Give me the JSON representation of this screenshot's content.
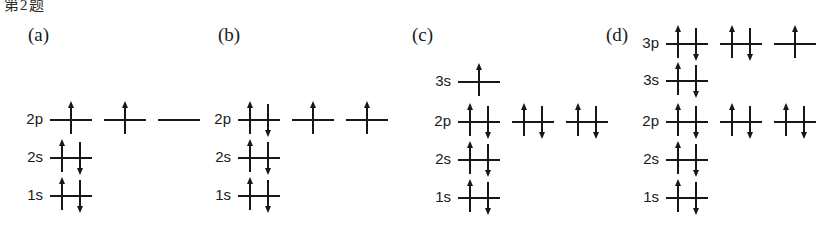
{
  "figure": {
    "crop_remnant_text": "第2题",
    "background_color": "#ffffff",
    "ink_color": "#171717"
  },
  "panels": [
    {
      "id": "a",
      "label": "(a)",
      "label_x": 28,
      "label_y": 25,
      "origin_x": 50,
      "levels": [
        {
          "name": "2p",
          "label": "2p",
          "y": 119,
          "orbitals": [
            {
              "electrons": [
                "up"
              ]
            },
            {
              "electrons": [
                "up"
              ]
            },
            {
              "electrons": []
            }
          ]
        },
        {
          "name": "2s",
          "label": "2s",
          "y": 157,
          "orbitals": [
            {
              "electrons": [
                "up",
                "down"
              ]
            }
          ]
        },
        {
          "name": "1s",
          "label": "1s",
          "y": 195,
          "orbitals": [
            {
              "electrons": [
                "up",
                "down"
              ]
            }
          ]
        }
      ]
    },
    {
      "id": "b",
      "label": "(b)",
      "label_x": 218,
      "label_y": 25,
      "origin_x": 238,
      "levels": [
        {
          "name": "2p",
          "label": "2p",
          "y": 119,
          "orbitals": [
            {
              "electrons": [
                "up",
                "down"
              ]
            },
            {
              "electrons": [
                "up"
              ]
            },
            {
              "electrons": [
                "up"
              ]
            }
          ]
        },
        {
          "name": "2s",
          "label": "2s",
          "y": 157,
          "orbitals": [
            {
              "electrons": [
                "up",
                "down"
              ]
            }
          ]
        },
        {
          "name": "1s",
          "label": "1s",
          "y": 195,
          "orbitals": [
            {
              "electrons": [
                "up",
                "down"
              ]
            }
          ]
        }
      ]
    },
    {
      "id": "c",
      "label": "(c)",
      "label_x": 412,
      "label_y": 25,
      "origin_x": 458,
      "levels": [
        {
          "name": "3s",
          "label": "3s",
          "y": 81,
          "orbitals": [
            {
              "electrons": [
                "up"
              ]
            }
          ]
        },
        {
          "name": "2p",
          "label": "2p",
          "y": 121,
          "orbitals": [
            {
              "electrons": [
                "up",
                "down"
              ]
            },
            {
              "electrons": [
                "up",
                "down"
              ]
            },
            {
              "electrons": [
                "up",
                "down"
              ]
            }
          ]
        },
        {
          "name": "2s",
          "label": "2s",
          "y": 159,
          "orbitals": [
            {
              "electrons": [
                "up",
                "down"
              ]
            }
          ]
        },
        {
          "name": "1s",
          "label": "1s",
          "y": 197,
          "orbitals": [
            {
              "electrons": [
                "up",
                "down"
              ]
            }
          ]
        }
      ]
    },
    {
      "id": "d",
      "label": "(d)",
      "label_x": 606,
      "label_y": 25,
      "origin_x": 666,
      "levels": [
        {
          "name": "3p",
          "label": "3p",
          "y": 43,
          "orbitals": [
            {
              "electrons": [
                "up",
                "down"
              ]
            },
            {
              "electrons": [
                "up",
                "down"
              ]
            },
            {
              "electrons": [
                "up"
              ]
            }
          ]
        },
        {
          "name": "3s",
          "label": "3s",
          "y": 80,
          "orbitals": [
            {
              "electrons": [
                "up",
                "down"
              ]
            }
          ]
        },
        {
          "name": "2p",
          "label": "2p",
          "y": 121,
          "orbitals": [
            {
              "electrons": [
                "up",
                "down"
              ]
            },
            {
              "electrons": [
                "up",
                "down"
              ]
            },
            {
              "electrons": [
                "up",
                "down"
              ]
            }
          ]
        },
        {
          "name": "2s",
          "label": "2s",
          "y": 159,
          "orbitals": [
            {
              "electrons": [
                "up",
                "down"
              ]
            }
          ]
        },
        {
          "name": "1s",
          "label": "1s",
          "y": 197,
          "orbitals": [
            {
              "electrons": [
                "up",
                "down"
              ]
            }
          ]
        }
      ]
    }
  ],
  "geometry": {
    "orbital_width": 42,
    "orbital_gap": 12,
    "electron_offset": 9
  }
}
